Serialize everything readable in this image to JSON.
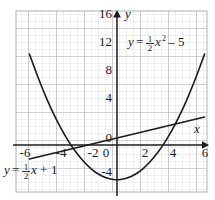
{
  "figure": {
    "type": "graph",
    "background": "#ffffff",
    "grid_color_minor": "#d8d8dc",
    "grid_color_major": "#b4b4ba",
    "axis_color": "#1a1a1a",
    "curve_color": "#1a1a1a",
    "text_color": "#1a1a1a"
  },
  "axes": {
    "x_axis_label": "x",
    "y_axis_label": "y",
    "x_ticks": [
      "-6",
      "-4",
      "-2",
      "0",
      "2",
      "4",
      "6"
    ],
    "x_tick_values": [
      -6,
      -4,
      -2,
      0,
      2,
      4,
      6
    ],
    "y_ticks": [
      "16",
      "12",
      "8",
      "4",
      "0",
      "-4"
    ],
    "y_tick_values": [
      16,
      12,
      8,
      4,
      0,
      -4
    ],
    "x_range": [
      -6.5,
      6.5
    ],
    "y_range": [
      -6.5,
      17.0
    ],
    "grid": "on",
    "minor_grid_step": 0.5,
    "major_grid_step": 2
  },
  "annotations": {
    "parabola_label": {
      "lhs": "y",
      "equals": "=",
      "coef_num": "1",
      "coef_den": "2",
      "variable": "x",
      "exponent": "2",
      "minus": "–",
      "constant": "5",
      "full": "y = 1/2 x² – 5"
    },
    "line_label": {
      "lhs": "y",
      "equals": "=",
      "coef_num": "1",
      "coef_den": "2",
      "variable": "x",
      "plus": "+",
      "constant": "1",
      "full": "y = 1/2 x + 1"
    }
  },
  "chart_data": {
    "type": "line",
    "title": "",
    "xlabel": "x",
    "ylabel": "y",
    "xlim": [
      -6.5,
      6.5
    ],
    "ylim": [
      -6.5,
      17.0
    ],
    "grid": true,
    "legend": "none",
    "series": [
      {
        "name": "y = 1/2 x^2 - 5",
        "kind": "parabola",
        "equation": "y = 0.5*x^2 - 5",
        "vertex": [
          0,
          -5
        ],
        "x_intercepts": [
          -3.162,
          3.162
        ],
        "y_intercept": -5,
        "x": [
          -6,
          -5.5,
          -5,
          -4.5,
          -4,
          -3.5,
          -3,
          -2.5,
          -2,
          -1.5,
          -1,
          -0.5,
          0,
          0.5,
          1,
          1.5,
          2,
          2.5,
          3,
          3.5,
          4,
          4.5,
          5,
          5.5,
          6
        ],
        "y": [
          13,
          10.125,
          7.5,
          5.125,
          3,
          1.125,
          -0.5,
          -1.875,
          -3,
          -3.875,
          -4.5,
          -4.875,
          -5,
          -4.875,
          -4.5,
          -3.875,
          -3,
          -1.875,
          -0.5,
          1.125,
          3,
          5.125,
          7.5,
          10.125,
          13
        ]
      },
      {
        "name": "y = 1/2 x + 1",
        "kind": "line",
        "equation": "y = 0.5*x + 1",
        "slope": 0.5,
        "intercept": 1,
        "x": [
          -6,
          6
        ],
        "y": [
          -2,
          4
        ]
      }
    ],
    "intersections": [
      [
        -2.0,
        0.0
      ],
      [
        6.0,
        4.0
      ]
    ]
  }
}
